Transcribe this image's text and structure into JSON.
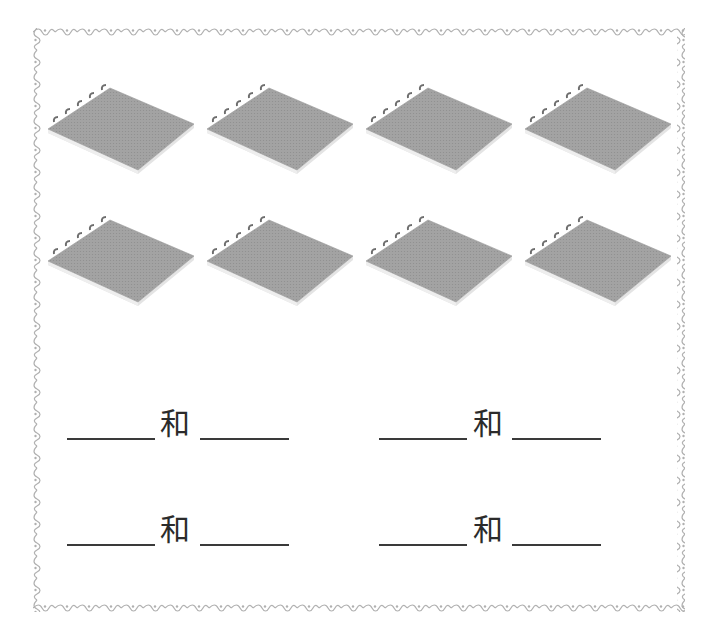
{
  "worksheet": {
    "border_style": "decorative-vine",
    "border_color": "#b5b5b5",
    "notebook_rows": [
      {
        "count": 4,
        "items": [
          "notebook",
          "notebook",
          "notebook",
          "notebook"
        ]
      },
      {
        "count": 4,
        "items": [
          "notebook",
          "notebook",
          "notebook",
          "notebook"
        ]
      }
    ],
    "total_notebooks": 8,
    "notebook_color": "#9a9a9a",
    "exercises": [
      {
        "left_blank": "",
        "connector": "和",
        "right_blank": ""
      },
      {
        "left_blank": "",
        "connector": "和",
        "right_blank": ""
      },
      {
        "left_blank": "",
        "connector": "和",
        "right_blank": ""
      },
      {
        "left_blank": "",
        "connector": "和",
        "right_blank": ""
      }
    ]
  }
}
